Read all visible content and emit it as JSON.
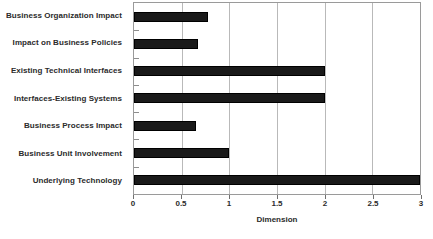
{
  "chart_data": {
    "type": "bar",
    "orientation": "horizontal",
    "title": "",
    "xlabel": "Dimension",
    "ylabel": "",
    "xlim": [
      0,
      3
    ],
    "xticks": [
      0,
      0.5,
      1,
      1.5,
      2,
      2.5,
      3
    ],
    "xticklabels": [
      "0",
      "0.5",
      "1",
      "1.5",
      "2",
      "2.5",
      "3"
    ],
    "grid": "vertical",
    "legend": "none",
    "bar_color": "#1a1a1a",
    "categories": [
      "Business Organization Impact",
      "Impact on Business Policies",
      "Existing Technical Interfaces",
      "Interfaces-Existing Systems",
      "Business Process Impact",
      "Business Unit Involvement",
      "Underlying Technology"
    ],
    "values": [
      0.78,
      0.67,
      2.0,
      2.0,
      0.65,
      1.0,
      3.0
    ]
  }
}
